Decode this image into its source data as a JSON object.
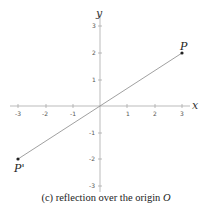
{
  "figure": {
    "axes": {
      "x_label": "x",
      "y_label": "y",
      "x_ticks": [
        "-3",
        "-2",
        "-1",
        "1",
        "2",
        "3"
      ],
      "y_ticks": [
        "3",
        "2",
        "1",
        "-1",
        "-2",
        "-3"
      ]
    },
    "points": {
      "P": {
        "label": "P",
        "x": 3,
        "y": 2
      },
      "P_prime": {
        "label": "P'",
        "x": -3,
        "y": -2
      }
    },
    "caption": {
      "text": "(c) reflection over the origin ",
      "variable": "O"
    }
  }
}
